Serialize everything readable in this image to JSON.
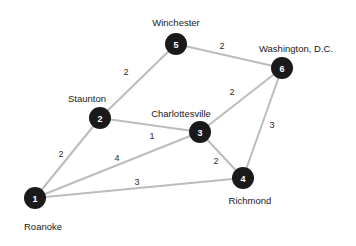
{
  "chart_data": {
    "type": "diagram",
    "title": "",
    "subtitle": "",
    "xlabel": "",
    "ylabel": "",
    "graph_kind": "weighted undirected graph",
    "colors": {
      "node_fill": "#1a1a1a",
      "node_label": "#ffffff",
      "edge_stroke": "#bcbcbc",
      "text": "#1a1a1a",
      "background": "#ffffff"
    },
    "nodes": [
      {
        "id": "1",
        "number": "1",
        "city": "Roanoke",
        "x": 35,
        "y": 198,
        "r": 11,
        "label_x": 43,
        "label_y": 226,
        "label_anchor": "middle"
      },
      {
        "id": "2",
        "number": "2",
        "city": "Staunton",
        "x": 100,
        "y": 118,
        "r": 11,
        "label_x": 87,
        "label_y": 98,
        "label_anchor": "middle"
      },
      {
        "id": "3",
        "number": "3",
        "city": "Charlottesville",
        "x": 200,
        "y": 132,
        "r": 11,
        "label_x": 181,
        "label_y": 113,
        "label_anchor": "middle"
      },
      {
        "id": "4",
        "number": "4",
        "city": "Richmond",
        "x": 243,
        "y": 178,
        "r": 11,
        "label_x": 250,
        "label_y": 200,
        "label_anchor": "middle"
      },
      {
        "id": "5",
        "number": "5",
        "city": "Winchester",
        "x": 176,
        "y": 44,
        "r": 11,
        "label_x": 176,
        "label_y": 22,
        "label_anchor": "middle"
      },
      {
        "id": "6",
        "number": "6",
        "city": "Washington, D.C.",
        "x": 282,
        "y": 68,
        "r": 11,
        "label_x": 296,
        "label_y": 48,
        "label_anchor": "middle"
      }
    ],
    "edges": [
      {
        "source": "1",
        "target": "2",
        "weight": "2",
        "label_x": 61,
        "label_y": 154
      },
      {
        "source": "1",
        "target": "3",
        "weight": "4",
        "label_x": 117,
        "label_y": 158
      },
      {
        "source": "1",
        "target": "4",
        "weight": "3",
        "label_x": 137,
        "label_y": 182
      },
      {
        "source": "2",
        "target": "3",
        "weight": "1",
        "label_x": 152,
        "label_y": 136
      },
      {
        "source": "2",
        "target": "5",
        "weight": "2",
        "label_x": 126,
        "label_y": 72
      },
      {
        "source": "3",
        "target": "4",
        "weight": "2",
        "label_x": 216,
        "label_y": 161
      },
      {
        "source": "3",
        "target": "6",
        "weight": "2",
        "label_x": 232,
        "label_y": 92
      },
      {
        "source": "4",
        "target": "6",
        "weight": "3",
        "label_x": 272,
        "label_y": 125
      },
      {
        "source": "5",
        "target": "6",
        "weight": "2",
        "label_x": 222,
        "label_y": 46
      }
    ]
  }
}
